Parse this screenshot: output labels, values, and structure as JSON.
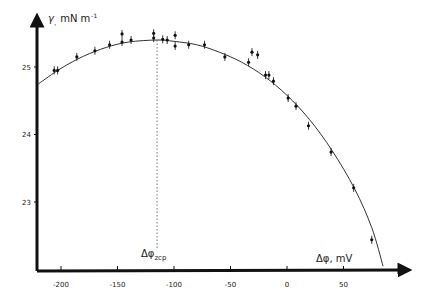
{
  "chart_data": {
    "type": "scatter",
    "title": "",
    "xlabel": "Δφ, mV",
    "ylabel": "γ, mN m⁻¹",
    "xlim": [
      -220,
      95
    ],
    "ylim": [
      22.0,
      25.8
    ],
    "grid": false,
    "legend": null,
    "x_ticks": [
      -200,
      -150,
      -100,
      -50,
      0,
      50
    ],
    "x_tick_labels": [
      "-200",
      "-150",
      "-100",
      "-50",
      "0",
      "50"
    ],
    "y_ticks": [
      23,
      24,
      25
    ],
    "y_tick_labels": [
      "23",
      "24",
      "25"
    ],
    "annotations": [
      {
        "text": "Δφ",
        "subscript": "zcp",
        "x": -115,
        "note": "dotted vertical line at zero-charge potential"
      }
    ],
    "series": [
      {
        "name": "measured",
        "type": "scatter",
        "error_bars": true,
        "x": [
          -206,
          -203,
          -186,
          -170,
          -157,
          -146,
          -146,
          -138,
          -118,
          -118,
          -110,
          -106,
          -99,
          -99,
          -87,
          -73,
          -55,
          -34,
          -31,
          -26,
          -19,
          -16,
          -12,
          1,
          8,
          19,
          39,
          59,
          75
        ],
        "y": [
          24.95,
          24.95,
          25.15,
          25.24,
          25.33,
          25.37,
          25.49,
          25.4,
          25.43,
          25.5,
          25.41,
          25.4,
          25.47,
          25.31,
          25.33,
          25.33,
          25.15,
          25.07,
          25.22,
          25.18,
          24.88,
          24.88,
          24.79,
          24.54,
          24.42,
          24.13,
          23.74,
          23.21,
          22.44
        ]
      },
      {
        "name": "fit",
        "type": "line",
        "x": [
          -220,
          -200,
          -180,
          -160,
          -140,
          -115,
          -100,
          -80,
          -60,
          -40,
          -20,
          0,
          20,
          40,
          60,
          75,
          85
        ],
        "y": [
          24.75,
          24.98,
          25.16,
          25.29,
          25.37,
          25.4,
          25.38,
          25.33,
          25.22,
          25.07,
          24.86,
          24.58,
          24.22,
          23.76,
          23.19,
          22.62,
          22.05
        ]
      }
    ]
  },
  "axes": {
    "y_label_main": "γ",
    "y_label_sub": ",",
    "y_label_units": "mN m",
    "y_label_exp": "-1",
    "x_label": "Δφ, mV",
    "zcp_label_main": "Δφ",
    "zcp_label_sub": "zcp"
  }
}
